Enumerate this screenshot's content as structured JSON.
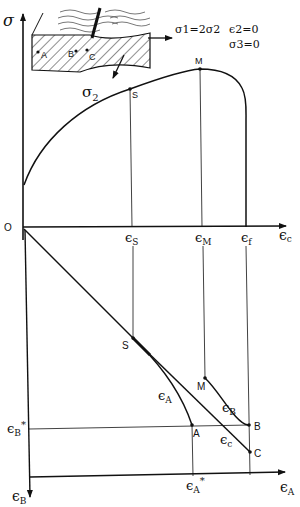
{
  "diagram": {
    "type": "forming-limit strain path construction",
    "stress_state": {
      "line1": "σ1=2σ2",
      "line2": "ε2=0",
      "line3": "σ3=0"
    },
    "specimen": {
      "stress_arrow_label": "σ2",
      "points": [
        "A",
        "B",
        "C"
      ]
    },
    "upper_plot": {
      "y_axis_label": "σ",
      "x_axis_label": "εc",
      "origin_label": "O",
      "curve_points": [
        "S",
        "M"
      ],
      "x_ticks": [
        "εS",
        "εM",
        "εf"
      ]
    },
    "lower_plot": {
      "x_axis_label": "εA",
      "y_axis_label": "εB",
      "tick_x": "εA*",
      "tick_y": "εB*",
      "points": [
        "S",
        "M",
        "A",
        "B",
        "C"
      ],
      "path_labels": [
        "εA",
        "εB",
        "εc"
      ]
    }
  },
  "labels": {
    "sigma": "σ",
    "sigma2": "σ",
    "sub2": "2",
    "O": "O",
    "S": "S",
    "M": "M",
    "A": "A",
    "B": "B",
    "C": "C",
    "eps": "ϵ",
    "subS": "S",
    "subM": "M",
    "subf": "f",
    "subc": "c",
    "subA": "A",
    "subB": "B",
    "star": "*",
    "cond1": "σ1=2σ2",
    "cond2": "ϵ2=0",
    "cond3": "σ3=0"
  }
}
